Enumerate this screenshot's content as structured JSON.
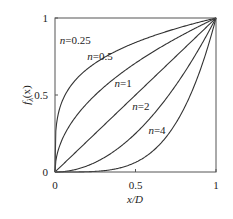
{
  "chart_data": {
    "type": "line",
    "title": "",
    "xlabel": "x/D",
    "ylabel": "f_λ(x)",
    "xlim": [
      0,
      1
    ],
    "ylim": [
      0,
      1
    ],
    "grid": false,
    "legend_position": "inline-labels",
    "x_ticks": [
      0,
      0.5,
      1
    ],
    "x_tick_labels": [
      "0",
      "0.5",
      "1"
    ],
    "y_ticks": [
      0,
      0.5,
      1
    ],
    "y_tick_labels": [
      "0",
      "0.5",
      "1"
    ],
    "function": "y = x^n",
    "series": [
      {
        "name": "n=0.25",
        "n": 0.25,
        "x": [
          0,
          0.0625,
          0.25,
          0.5,
          0.75,
          1
        ],
        "values": [
          0,
          0.5,
          0.707,
          0.841,
          0.931,
          1
        ],
        "label_pos": [
          0.03,
          0.83
        ]
      },
      {
        "name": "n=0.5",
        "n": 0.5,
        "x": [
          0,
          0.25,
          0.5,
          0.75,
          1
        ],
        "values": [
          0,
          0.5,
          0.707,
          0.866,
          1
        ],
        "label_pos": [
          0.2,
          0.73
        ]
      },
      {
        "name": "n=1",
        "n": 1,
        "x": [
          0,
          0.25,
          0.5,
          0.75,
          1
        ],
        "values": [
          0,
          0.25,
          0.5,
          0.75,
          1
        ],
        "label_pos": [
          0.37,
          0.55
        ]
      },
      {
        "name": "n=2",
        "n": 2,
        "x": [
          0,
          0.25,
          0.5,
          0.75,
          1
        ],
        "values": [
          0,
          0.0625,
          0.25,
          0.5625,
          1
        ],
        "label_pos": [
          0.48,
          0.4
        ]
      },
      {
        "name": "n=4",
        "n": 4,
        "x": [
          0,
          0.25,
          0.5,
          0.75,
          0.857,
          1
        ],
        "values": [
          0,
          0.004,
          0.0625,
          0.316,
          0.54,
          1
        ],
        "label_pos": [
          0.58,
          0.25
        ]
      }
    ]
  },
  "labels": {
    "x_axis": "x/D",
    "y_axis_main": "f",
    "y_axis_sub": "λ",
    "y_axis_paren": "(x)"
  }
}
